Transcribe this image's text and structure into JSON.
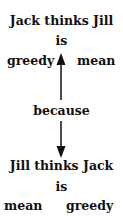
{
  "top": {
    "sentence": "Jack thinks Jill",
    "verb": "is",
    "left_word": "greedy",
    "right_word": "mean"
  },
  "connector": "because",
  "bottom": {
    "sentence": "Jill thinks Jack",
    "verb": "is",
    "left_word": "mean",
    "right_word": "greedy"
  },
  "arrows": [
    {
      "direction": "up",
      "from": "because",
      "to": "top"
    },
    {
      "direction": "down",
      "from": "because",
      "to": "bottom"
    }
  ]
}
